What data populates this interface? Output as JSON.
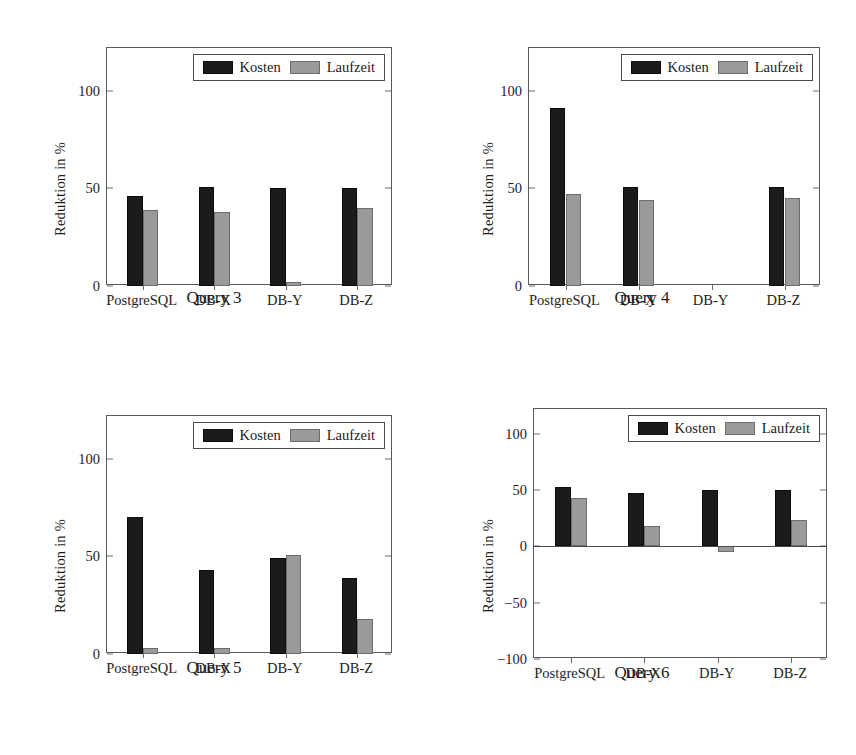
{
  "figure": {
    "series_names": [
      "Kosten",
      "Laufzeit"
    ],
    "categories": [
      "PostgreSQL",
      "DB-X",
      "DB-Y",
      "DB-Z"
    ],
    "y_axis_label": "Reduktion in %",
    "colors": {
      "kosten": "#1b1b1b",
      "laufzeit": "#9a9a9a",
      "frame": "#595959",
      "background": "#ffffff"
    }
  },
  "panels": [
    {
      "caption": "Query 3",
      "ylabel": "Reduktion in %",
      "yticks": [
        "0",
        "50",
        "100"
      ],
      "ytick_values": [
        0,
        50,
        100
      ],
      "ylim": [
        0,
        122
      ],
      "legend": {
        "kosten": "Kosten",
        "laufzeit": "Laufzeit"
      },
      "categories": [
        "PostgreSQL",
        "DB-X",
        "DB-Y",
        "DB-Z"
      ],
      "kosten": [
        46,
        51,
        50,
        50
      ],
      "laufzeit": [
        39,
        38,
        2,
        40
      ]
    },
    {
      "caption": "Query 4",
      "ylabel": "Reduktion in %",
      "yticks": [
        "0",
        "50",
        "100"
      ],
      "ytick_values": [
        0,
        50,
        100
      ],
      "ylim": [
        0,
        122
      ],
      "legend": {
        "kosten": "Kosten",
        "laufzeit": "Laufzeit"
      },
      "categories": [
        "PostgreSQL",
        "DB-X",
        "DB-Y",
        "DB-Z"
      ],
      "kosten": [
        91,
        51,
        0,
        51
      ],
      "laufzeit": [
        47,
        44,
        0,
        45
      ]
    },
    {
      "caption": "Query 5",
      "ylabel": "Reduktion in %",
      "yticks": [
        "0",
        "50",
        "100"
      ],
      "ytick_values": [
        0,
        50,
        100
      ],
      "ylim": [
        0,
        122
      ],
      "legend": {
        "kosten": "Kosten",
        "laufzeit": "Laufzeit"
      },
      "categories": [
        "PostgreSQL",
        "DB-X",
        "DB-Y",
        "DB-Z"
      ],
      "kosten": [
        70,
        43,
        49,
        39
      ],
      "laufzeit": [
        3,
        3,
        51,
        18
      ]
    },
    {
      "caption": "Query 6",
      "ylabel": "Reduktion in %",
      "yticks": [
        "-100",
        "-50",
        "0",
        "50",
        "100"
      ],
      "ytick_values": [
        -100,
        -50,
        0,
        50,
        100
      ],
      "ylim": [
        -100,
        122
      ],
      "legend": {
        "kosten": "Kosten",
        "laufzeit": "Laufzeit"
      },
      "categories": [
        "PostgreSQL",
        "DB-X",
        "DB-Y",
        "DB-Z"
      ],
      "kosten": [
        53,
        47,
        50,
        50
      ],
      "laufzeit": [
        43,
        18,
        -5,
        23
      ]
    }
  ],
  "chart_data": {
    "type": "bar",
    "title": "",
    "xlabel": "",
    "ylabel": "Reduktion in %",
    "categories": [
      "PostgreSQL",
      "DB-X",
      "DB-Y",
      "DB-Z"
    ],
    "legend_position": "top-right inside axes",
    "grid": false,
    "subplots": [
      {
        "title": "Query 3",
        "ylim": [
          0,
          122
        ],
        "yticks": [
          0,
          50,
          100
        ],
        "series": [
          {
            "name": "Kosten",
            "values": [
              46,
              51,
              50,
              50
            ]
          },
          {
            "name": "Laufzeit",
            "values": [
              39,
              38,
              2,
              40
            ]
          }
        ]
      },
      {
        "title": "Query 4",
        "ylim": [
          0,
          122
        ],
        "yticks": [
          0,
          50,
          100
        ],
        "series": [
          {
            "name": "Kosten",
            "values": [
              91,
              51,
              0,
              51
            ]
          },
          {
            "name": "Laufzeit",
            "values": [
              47,
              44,
              0,
              45
            ]
          }
        ]
      },
      {
        "title": "Query 5",
        "ylim": [
          0,
          122
        ],
        "yticks": [
          0,
          50,
          100
        ],
        "series": [
          {
            "name": "Kosten",
            "values": [
              70,
              43,
              49,
              39
            ]
          },
          {
            "name": "Laufzeit",
            "values": [
              3,
              3,
              51,
              18
            ]
          }
        ]
      },
      {
        "title": "Query 6",
        "ylim": [
          -100,
          122
        ],
        "yticks": [
          -100,
          -50,
          0,
          50,
          100
        ],
        "series": [
          {
            "name": "Kosten",
            "values": [
              53,
              47,
              50,
              50
            ]
          },
          {
            "name": "Laufzeit",
            "values": [
              43,
              18,
              -5,
              23
            ]
          }
        ]
      }
    ]
  }
}
